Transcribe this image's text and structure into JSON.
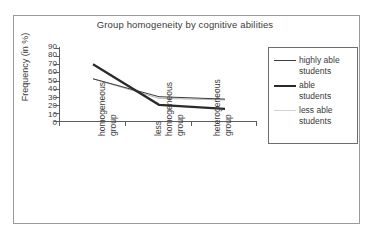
{
  "chart_data": {
    "type": "line",
    "title": "Group homogeneity by cognitive abilities",
    "xlabel": "",
    "ylabel": "Frequency (in %)",
    "ylim": [
      0,
      90
    ],
    "yticks": [
      90,
      80,
      70,
      60,
      50,
      40,
      30,
      20,
      10,
      0
    ],
    "grid": false,
    "legend_position": "right",
    "categories": [
      "homogeneous group",
      "less homogeneous group",
      "heterogeneous group"
    ],
    "series": [
      {
        "name": "highly able students",
        "values": [
          52,
          30,
          27
        ],
        "color": "#3c3c3c",
        "width": 1.0
      },
      {
        "name": "able students",
        "values": [
          70,
          20,
          15
        ],
        "color": "#2a2a2a",
        "width": 2.2
      },
      {
        "name": "less able students",
        "values": [
          52,
          28,
          26
        ],
        "color": "#b4b4b4",
        "width": 1.0
      }
    ]
  },
  "chart": {
    "title": "Group homogeneity by cognitive abilities",
    "y_axis_title": "Frequency (in %)",
    "y_tick_labels": [
      "90",
      "80",
      "70",
      "60",
      "50",
      "40",
      "30",
      "20",
      "10",
      "0"
    ],
    "x_categories": [
      {
        "line1": "homogeneous",
        "line2": "group"
      },
      {
        "line1": "less",
        "line2": "homogeneous",
        "line3": "group"
      },
      {
        "line1": "heterogeneous",
        "line2": "group"
      }
    ],
    "legend": [
      {
        "label_line1": "highly able",
        "label_line2": "students",
        "style": "thin-dark"
      },
      {
        "label_line1": "able",
        "label_line2": "students",
        "style": "thick-dark"
      },
      {
        "label_line1": "less able",
        "label_line2": "students",
        "style": "thin-light"
      }
    ]
  },
  "colors": {
    "frame": "#9a9a9a",
    "axis": "#5c5c5c",
    "text": "#3a3a3a",
    "series_highly_able": "#3c3c3c",
    "series_able": "#2a2a2a",
    "series_less_able": "#b4b4b4",
    "legend_border": "#6d6d6d",
    "background": "#ffffff"
  }
}
